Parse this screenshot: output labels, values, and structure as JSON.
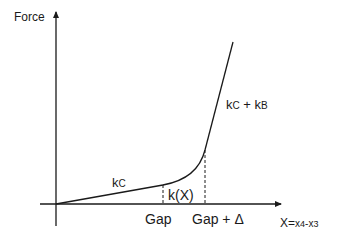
{
  "diagram": {
    "y_axis_label": "Force",
    "x_axis_label": {
      "main": "X=",
      "var1": "x",
      "sub1": "4",
      "minus": "-",
      "var2": "x",
      "sub2": "3"
    },
    "segments": [
      {
        "name": "kc",
        "label_k": "k",
        "label_sub": "C"
      },
      {
        "name": "kx",
        "label": "k(X)"
      },
      {
        "name": "kc-plus-kb",
        "label_k1": "k",
        "label_sub1": "C",
        "plus": " + ",
        "label_k2": "k",
        "label_sub2": "B"
      }
    ],
    "x_markers": [
      {
        "label": "Gap"
      },
      {
        "label": "Gap + Δ"
      }
    ],
    "colors": {
      "line": "#1a1a1a",
      "axis": "#1a1a1a",
      "background": "#ffffff"
    }
  }
}
